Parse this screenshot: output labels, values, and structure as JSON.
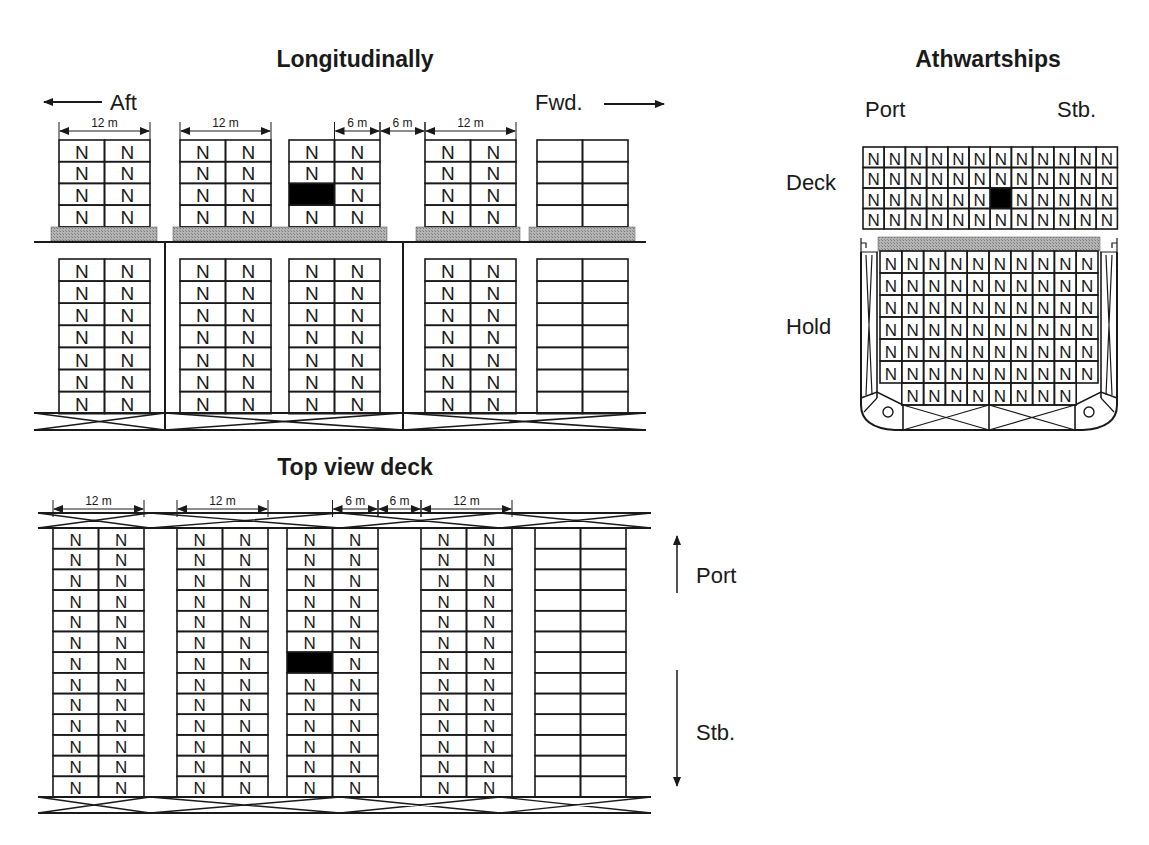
{
  "colors": {
    "ink": "#1a1a1a",
    "hatch": "#a8a8a8",
    "empty_reefer": "#000000",
    "background": "#ffffff"
  },
  "longitudinal": {
    "title": "Longitudinally",
    "aft_label": "Aft",
    "fwd_label": "Fwd.",
    "dimensions": [
      "12 m",
      "12 m",
      "6 m",
      "6 m",
      "12 m"
    ],
    "deck_rows": 4,
    "hold_rows": 7,
    "bays": [
      {
        "x": 59,
        "cols": 2,
        "label": "N"
      },
      {
        "x": 180,
        "cols": 2,
        "label": "N"
      },
      {
        "x": 289,
        "cols": 2,
        "label": "N",
        "black_cell": {
          "row": 2,
          "col": 0
        }
      },
      {
        "x": 425,
        "cols": 2,
        "label": "N"
      },
      {
        "x": 537,
        "cols": 2,
        "label": ""
      }
    ]
  },
  "top_view": {
    "title": "Top view deck",
    "dimensions": [
      "12 m",
      "12 m",
      "6 m",
      "6 m",
      "12 m"
    ],
    "rows": 13,
    "port_label": "Port",
    "stb_label": "Stb.",
    "black_cell": {
      "bay": 2,
      "row": 6,
      "col": 0
    }
  },
  "athwartships": {
    "title": "Athwartships",
    "port_label": "Port",
    "stb_label": "Stb.",
    "deck_label": "Deck",
    "hold_label": "Hold",
    "deck_cols": 12,
    "deck_rows": 4,
    "deck_black_cell": {
      "row": 2,
      "col": 6
    },
    "hold_cols": 10,
    "hold_rows": 6,
    "hold_bottom_row_cols": 8,
    "cell_label": "N"
  }
}
